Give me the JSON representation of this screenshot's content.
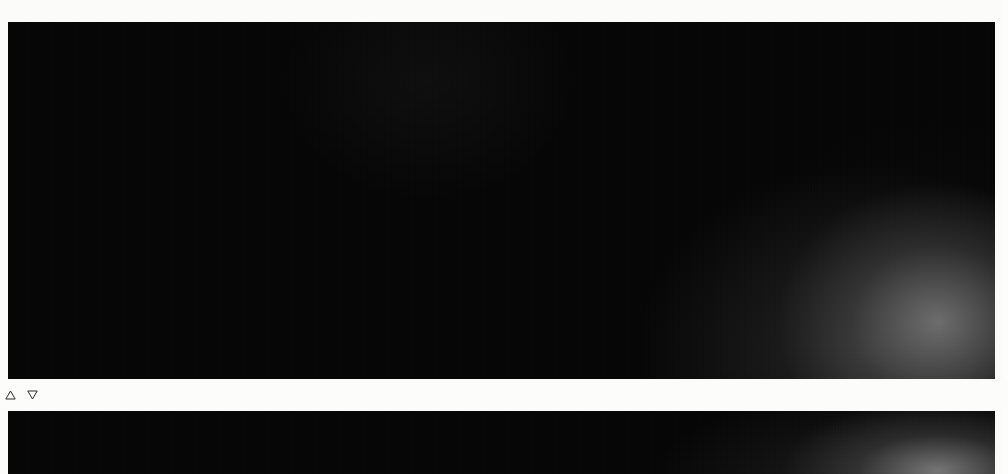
{
  "page": {
    "background_color": "#fbfbf9",
    "panel_color": "#050505"
  },
  "navigation": {
    "prev": {
      "icon": "triangle-up-icon",
      "label": "28"
    },
    "next": {
      "icon": "triangle-down-icon",
      "label": "29"
    }
  },
  "chart_data": [
    {
      "id": "chart-top",
      "type": "bar",
      "title": "",
      "subtitle": "",
      "xlabel": "",
      "ylabel": "",
      "grid": false,
      "legend": "none",
      "style": "3d-isometric",
      "ylim": [
        0,
        925.274
      ],
      "axis_labels_position": "both-top-and-bottom",
      "categories": [
        "1963.",
        "1964.",
        "1965.",
        "1966.",
        "1967.",
        "1968.",
        "1969.",
        "1970.",
        "1971.",
        "1972.",
        "1973.",
        "1974.",
        "1975.",
        "1976.",
        "1977.",
        "1978.",
        "1979.",
        "1980."
      ],
      "values": [
        21.098,
        24.993,
        28.456,
        36.882,
        47.198,
        55.642,
        61.633,
        66.822,
        124.427,
        142.151,
        151.92,
        211.661,
        274.614,
        282.213,
        331.033,
        458.177,
        512.589,
        925.274
      ],
      "value_labels": [
        "21.098",
        "24.993",
        "28.456",
        "36.882",
        "47.198",
        "55.642",
        "61.633",
        "66.822",
        "124.427",
        "142.151",
        "151.920",
        "211.661",
        "274.614",
        "282.213",
        "331.033",
        "458.177",
        "512.589",
        "925.274"
      ],
      "tick_labels_top": [
        "1963.",
        "1964.",
        "1965.",
        "1966.",
        "1967.",
        "1968.",
        "1969.",
        "1970.",
        "1971.",
        "1972.",
        "1973.",
        "1974.",
        "1975.",
        "1976.",
        "1977.",
        "1978.",
        "1979.",
        "1980."
      ],
      "tick_labels_bottom": [
        "1963.",
        "1964.",
        "1965.",
        "1966.",
        "1967.",
        "1968.",
        "1969.",
        "1970.",
        "1971.",
        "1972.",
        "1973.",
        "1974.",
        "1975.",
        "1976.",
        "1977.",
        "1978.",
        "1979.",
        "1980."
      ],
      "colors": {
        "top_face": "#b9b9b9",
        "right_face": "#9a9a9a",
        "left_face": "#3a3a3a",
        "label": "#fbfaf7"
      }
    },
    {
      "id": "chart-bottom",
      "type": "bar",
      "title": "",
      "subtitle": "",
      "xlabel": "",
      "ylabel": "",
      "grid": false,
      "legend": "none",
      "style": "3d-isometric",
      "note": "second chart, top edge only visible at bottom of page",
      "categories": [
        "1963.",
        "1964.",
        "1965.",
        "1966.",
        "1967.",
        "1968.",
        "1969.",
        "1970.",
        "1971.",
        "1972.",
        "1973.",
        "1974.",
        "1975.",
        "1976.",
        "1977.",
        "1978.",
        "1979.",
        "1980."
      ],
      "tick_labels_top": [
        "1963.",
        "1964.",
        "1965.",
        "1966.",
        "1967.",
        "1968.",
        "1969.",
        "1970.",
        "1971.",
        "1972.",
        "1973.",
        "1974.",
        "1975.",
        "1976.",
        "1977.",
        "I978.",
        "1979.",
        ""
      ],
      "value_labels": [
        "438"
      ],
      "values": [
        438
      ],
      "colors": {
        "top_face": "#c3c3c3",
        "right_face": "#9d9d9d",
        "left_face": "#3d3d3d",
        "label": "#fbfaf7"
      }
    }
  ]
}
